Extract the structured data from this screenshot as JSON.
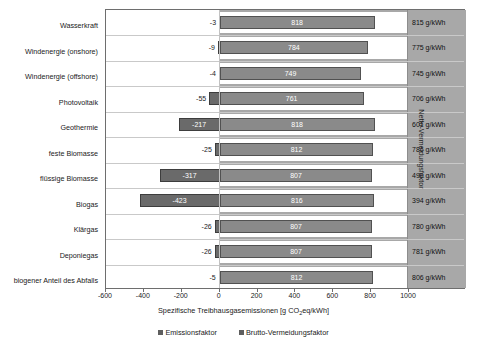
{
  "chart_data": {
    "type": "bar",
    "title": "",
    "xlabel": "Spezifische Treibhausgasemissionen [g CO2eq/kWh]",
    "ylabel": "",
    "right_axis_label": "Netto-Vermeidungsfaktor",
    "xlim": [
      -600,
      1000
    ],
    "xticks": [
      -600,
      -400,
      -200,
      0,
      200,
      400,
      600,
      800,
      1000
    ],
    "xtick_labels": [
      "-600",
      "-400",
      "-200",
      "0",
      "200",
      "400",
      "600",
      "800",
      "1000"
    ],
    "grid": false,
    "legend_position": "bottom",
    "orientation": "horizontal",
    "categories": [
      "Wasserkraft",
      "Windenergie (onshore)",
      "Windenergie (offshore)",
      "Photovoltaik",
      "Geothermie",
      "feste Biomasse",
      "flüssige Biomasse",
      "Biogas",
      "Klärgas",
      "Deponiegas",
      "biogener Anteil des Abfalls"
    ],
    "series": [
      {
        "name": "Emissionsfaktor",
        "color": "#6a6a6a",
        "values": [
          -3,
          -9,
          -4,
          -55,
          -217,
          -25,
          -317,
          -423,
          -26,
          -26,
          -5
        ]
      },
      {
        "name": "Brutto-Vermeidungsfaktor",
        "color": "#8a8a8a",
        "values": [
          818,
          784,
          749,
          761,
          818,
          812,
          807,
          816,
          807,
          807,
          812
        ]
      }
    ],
    "right_values": [
      "815 g/kWh",
      "775 g/kWh",
      "745 g/kWh",
      "706 g/kWh",
      "601 g/kWh",
      "786 g/kWh",
      "490 g/kWh",
      "394 g/kWh",
      "780 g/kWh",
      "781 g/kWh",
      "806 g/kWh"
    ],
    "legend": [
      "Emissionsfaktor",
      "Brutto-Vermeidungsfaktor"
    ]
  },
  "colors": {
    "emission_bar": "#6a6a6a",
    "avoidance_bar": "#8a8a8a",
    "band": "#a8a8a8",
    "frame": "#6e6e6e"
  }
}
